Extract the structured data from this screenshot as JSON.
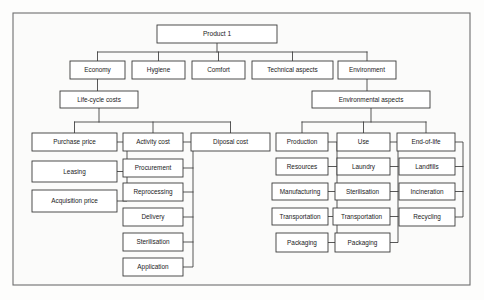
{
  "diagram": {
    "type": "hierarchy-tree",
    "frame": {
      "x": 13,
      "y": 13,
      "width": 457,
      "height": 272
    },
    "colors": {
      "background": "#fdfdfc",
      "box_fill": "#ffffff",
      "box_stroke": "#3a3a3a",
      "connector": "#3a3a3a",
      "frame_stroke": "#6e6e6e",
      "text": "#1a1a1a"
    },
    "levels": [
      {
        "level": 0,
        "name": "root"
      },
      {
        "level": 1,
        "name": "main-aspects"
      },
      {
        "level": 2,
        "name": "sub-aspects"
      },
      {
        "level": 3,
        "name": "categories"
      },
      {
        "level": 4,
        "name": "items"
      }
    ],
    "nodes": [
      {
        "id": "product1",
        "label": "Product 1",
        "level": 0,
        "x": 157,
        "y": 25,
        "w": 120,
        "h": 18,
        "parent": null
      },
      {
        "id": "economy",
        "label": "Economy",
        "level": 1,
        "x": 70,
        "y": 61,
        "w": 55,
        "h": 18,
        "parent": "product1"
      },
      {
        "id": "hygiene",
        "label": "Hygiene",
        "level": 1,
        "x": 132,
        "y": 61,
        "w": 53,
        "h": 18,
        "parent": "product1"
      },
      {
        "id": "comfort",
        "label": "Comfort",
        "level": 1,
        "x": 192,
        "y": 61,
        "w": 53,
        "h": 18,
        "parent": "product1"
      },
      {
        "id": "technical",
        "label": "Technical aspects",
        "level": 1,
        "x": 252,
        "y": 61,
        "w": 81,
        "h": 18,
        "parent": "product1"
      },
      {
        "id": "environment",
        "label": "Environment",
        "level": 1,
        "x": 338,
        "y": 61,
        "w": 58,
        "h": 18,
        "parent": "product1"
      },
      {
        "id": "lifecycle",
        "label": "Life-cycle costs",
        "level": 2,
        "x": 60,
        "y": 91,
        "w": 78,
        "h": 17,
        "parent": "economy"
      },
      {
        "id": "envaspects",
        "label": "Environmental aspects",
        "level": 2,
        "x": 312,
        "y": 91,
        "w": 118,
        "h": 17,
        "parent": "environment"
      },
      {
        "id": "purchase",
        "label": "Purchase price",
        "level": 3,
        "x": 32,
        "y": 133,
        "w": 85,
        "h": 18,
        "parent": "lifecycle"
      },
      {
        "id": "activity",
        "label": "Activity cost",
        "level": 3,
        "x": 123,
        "y": 133,
        "w": 60,
        "h": 18,
        "parent": "lifecycle"
      },
      {
        "id": "diposal",
        "label": "Diposal cost",
        "level": 3,
        "x": 191,
        "y": 133,
        "w": 79,
        "h": 18,
        "parent": "lifecycle"
      },
      {
        "id": "production",
        "label": "Production",
        "level": 3,
        "x": 276,
        "y": 133,
        "w": 52,
        "h": 18,
        "parent": "envaspects"
      },
      {
        "id": "use",
        "label": "Use",
        "level": 3,
        "x": 337,
        "y": 133,
        "w": 53,
        "h": 18,
        "parent": "envaspects"
      },
      {
        "id": "endoflife",
        "label": "End-of-life",
        "level": 3,
        "x": 397,
        "y": 133,
        "w": 58,
        "h": 18,
        "parent": "envaspects"
      },
      {
        "id": "leasing",
        "label": "Leasing",
        "level": 4,
        "x": 32,
        "y": 161,
        "w": 85,
        "h": 21,
        "parent": "purchase"
      },
      {
        "id": "acquisition",
        "label": "Acquisition price",
        "level": 4,
        "x": 32,
        "y": 190,
        "w": 85,
        "h": 22,
        "parent": "purchase"
      },
      {
        "id": "procurement",
        "label": "Procurement",
        "level": 4,
        "x": 123,
        "y": 159,
        "w": 60,
        "h": 18,
        "parent": "activity"
      },
      {
        "id": "reprocessing",
        "label": "Reprocessing",
        "level": 4,
        "x": 123,
        "y": 183,
        "w": 60,
        "h": 18,
        "parent": "activity"
      },
      {
        "id": "delivery",
        "label": "Delivery",
        "level": 4,
        "x": 123,
        "y": 208,
        "w": 60,
        "h": 18,
        "parent": "activity"
      },
      {
        "id": "sterilisation-a",
        "label": "Sterilisation",
        "level": 4,
        "x": 123,
        "y": 233,
        "w": 60,
        "h": 18,
        "parent": "activity"
      },
      {
        "id": "application",
        "label": "Application",
        "level": 4,
        "x": 123,
        "y": 258,
        "w": 60,
        "h": 18,
        "parent": "activity"
      },
      {
        "id": "resources",
        "label": "Resources",
        "level": 4,
        "x": 276,
        "y": 158,
        "w": 52,
        "h": 17,
        "parent": "production"
      },
      {
        "id": "manufacturing",
        "label": "Manufacturing",
        "level": 4,
        "x": 272,
        "y": 183,
        "w": 56,
        "h": 17,
        "parent": "production"
      },
      {
        "id": "transportation-p",
        "label": "Transportation",
        "level": 4,
        "x": 272,
        "y": 208,
        "w": 56,
        "h": 17,
        "parent": "production"
      },
      {
        "id": "packaging-p",
        "label": "Packaging",
        "level": 4,
        "x": 276,
        "y": 233,
        "w": 52,
        "h": 19,
        "parent": "production"
      },
      {
        "id": "laundry",
        "label": "Laundry",
        "level": 4,
        "x": 337,
        "y": 158,
        "w": 53,
        "h": 17,
        "parent": "use"
      },
      {
        "id": "sterilisation-u",
        "label": "Sterilisation",
        "level": 4,
        "x": 335,
        "y": 183,
        "w": 55,
        "h": 17,
        "parent": "use"
      },
      {
        "id": "transportation-u",
        "label": "Transportation",
        "level": 4,
        "x": 333,
        "y": 208,
        "w": 57,
        "h": 17,
        "parent": "use"
      },
      {
        "id": "packaging-u",
        "label": "Packaging",
        "level": 4,
        "x": 335,
        "y": 233,
        "w": 55,
        "h": 19,
        "parent": "use"
      },
      {
        "id": "landfills",
        "label": "Landfills",
        "level": 4,
        "x": 399,
        "y": 158,
        "w": 56,
        "h": 17,
        "parent": "endoflife"
      },
      {
        "id": "incineration",
        "label": "Incineration",
        "level": 4,
        "x": 399,
        "y": 183,
        "w": 56,
        "h": 17,
        "parent": "endoflife"
      },
      {
        "id": "recycling",
        "label": "Recycling",
        "level": 4,
        "x": 399,
        "y": 208,
        "w": 56,
        "h": 18,
        "parent": "endoflife"
      }
    ],
    "connectors": [
      {
        "id": "c-root-bus",
        "kind": "bus",
        "d": "M 217 43 L 217 52 M 97.5 52 L 367 52 M 97.5 52 L 97.5 61 M 158.5 52 L 158.5 61 M 218.5 52 L 218.5 61 M 292.5 52 L 292.5 61 M 367 52 L 367 61"
      },
      {
        "id": "c-economy-lifecycle",
        "kind": "straight",
        "d": "M 97.5 79 L 97.5 91"
      },
      {
        "id": "c-environment-envaspects",
        "kind": "straight",
        "d": "M 367 79 L 367 91"
      },
      {
        "id": "c-lifecycle-bus",
        "kind": "bus",
        "d": "M 99 108 L 99 122 M 74.5 122 L 230.5 122 M 74.5 122 L 74.5 133 M 153 122 L 153 133 M 230.5 122 L 230.5 133"
      },
      {
        "id": "c-envaspects-bus",
        "kind": "bus",
        "d": "M 371 108 L 371 122 M 302 122 L 426 122 M 302 122 L 302 133 M 363.5 122 L 363.5 133 M 426 122 L 426 133"
      },
      {
        "id": "c-purchase-spine",
        "kind": "spine",
        "d": "M 117 142 L 127 142 L 127 201 L 117 201 M 127 171.5 L 117 171.5"
      },
      {
        "id": "c-activity-spine",
        "kind": "spine",
        "d": "M 183 142 L 193 142 L 193 267 L 183 267 M 193 168 L 183 168 M 193 192 L 183 192 M 193 217 L 183 217 M 193 242 L 183 242"
      },
      {
        "id": "c-production-spine",
        "kind": "spine",
        "d": "M 328 142 L 337 142 L 337 242.5 L 328 242.5 M 337 166.5 L 328 166.5 M 337 191.5 L 328 191.5 M 337 216.5 L 328 216.5"
      },
      {
        "id": "c-use-spine",
        "kind": "spine",
        "d": "M 390 142 L 398 142 L 398 242.5 L 390 242.5 M 398 166.5 L 390 166.5 M 398 191.5 L 390 191.5 M 398 216.5 L 390 216.5"
      },
      {
        "id": "c-endoflife-spine",
        "kind": "spine",
        "d": "M 455 142 L 463 142 L 463 217 L 455 217 M 463 166.5 L 455 166.5 M 463 191.5 L 455 191.5"
      }
    ]
  }
}
